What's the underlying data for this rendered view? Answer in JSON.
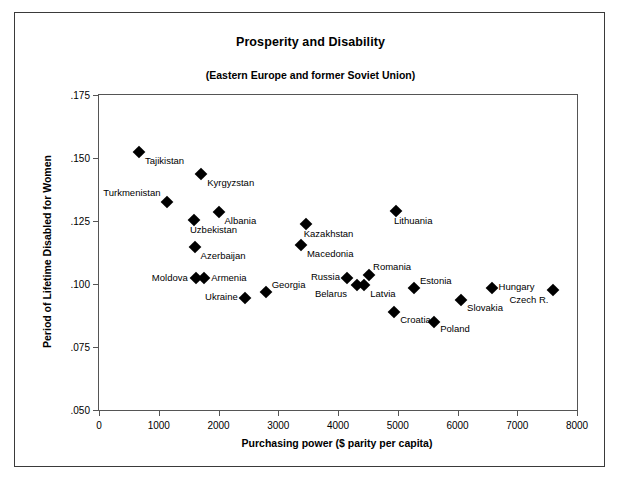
{
  "chart_data": {
    "type": "scatter",
    "title": "Prosperity and Disability",
    "subtitle": "(Eastern Europe and former Soviet Union)",
    "xlabel": "Purchasing power ($ parity per capita)",
    "ylabel": "Period of Lifetime Disabled for Women",
    "xlim": [
      0,
      8000
    ],
    "ylim": [
      0.05,
      0.175
    ],
    "xticks": [
      0,
      1000,
      2000,
      3000,
      4000,
      5000,
      6000,
      7000,
      8000
    ],
    "xticklabels": [
      "0",
      "1000",
      "2000",
      "3000",
      "4000",
      "5000",
      "6000",
      "7000",
      "8000"
    ],
    "yticks": [
      0.05,
      0.075,
      0.1,
      0.125,
      0.15,
      0.175
    ],
    "yticklabels": [
      ".050",
      ".075",
      ".100",
      ".125",
      ".150",
      ".175"
    ],
    "grid": false,
    "legend": false,
    "marker": "diamond",
    "marker_color": "#000000",
    "points": [
      {
        "label": "Tajikistan",
        "x": 670,
        "y": 0.1525,
        "lx": 6,
        "ly": 4,
        "anchor": "start"
      },
      {
        "label": "Kyrgyzstan",
        "x": 1710,
        "y": 0.1435,
        "lx": 6,
        "ly": 4,
        "anchor": "start"
      },
      {
        "label": "Turkmenistan",
        "x": 1130,
        "y": 0.1325,
        "lx": -6,
        "ly": -14,
        "anchor": "end"
      },
      {
        "label": "Uzbekistan",
        "x": 1590,
        "y": 0.1255,
        "lx": -4,
        "ly": 5,
        "anchor": "start"
      },
      {
        "label": "Albania",
        "x": 2000,
        "y": 0.1285,
        "lx": 6,
        "ly": 4,
        "anchor": "start"
      },
      {
        "label": "Azerbaijan",
        "x": 1600,
        "y": 0.1145,
        "lx": 6,
        "ly": 4,
        "anchor": "start"
      },
      {
        "label": "Moldova",
        "x": 1620,
        "y": 0.1025,
        "lx": -8,
        "ly": -5,
        "anchor": "end"
      },
      {
        "label": "Armenia",
        "x": 1760,
        "y": 0.1025,
        "lx": 7,
        "ly": -5,
        "anchor": "start"
      },
      {
        "label": "Ukraine",
        "x": 2440,
        "y": 0.0945,
        "lx": -7,
        "ly": -6,
        "anchor": "end"
      },
      {
        "label": "Georgia",
        "x": 2790,
        "y": 0.097,
        "lx": 6,
        "ly": -12,
        "anchor": "start"
      },
      {
        "label": "Kazakhstan",
        "x": 3460,
        "y": 0.124,
        "lx": -2,
        "ly": 5,
        "anchor": "start"
      },
      {
        "label": "Macedonia",
        "x": 3380,
        "y": 0.1155,
        "lx": 6,
        "ly": 4,
        "anchor": "start"
      },
      {
        "label": "Lithuania",
        "x": 4970,
        "y": 0.129,
        "lx": -2,
        "ly": 5,
        "anchor": "start"
      },
      {
        "label": "Russia",
        "x": 4150,
        "y": 0.1025,
        "lx": -7,
        "ly": -6,
        "anchor": "end"
      },
      {
        "label": "Romania",
        "x": 4520,
        "y": 0.1035,
        "lx": 4,
        "ly": -13,
        "anchor": "start"
      },
      {
        "label": "Belarus",
        "x": 4320,
        "y": 0.0995,
        "lx": -10,
        "ly": 4,
        "anchor": "end"
      },
      {
        "label": "Latvia",
        "x": 4440,
        "y": 0.0995,
        "lx": 6,
        "ly": 4,
        "anchor": "start"
      },
      {
        "label": "Estonia",
        "x": 5270,
        "y": 0.0985,
        "lx": 6,
        "ly": -12,
        "anchor": "start"
      },
      {
        "label": "Croatia",
        "x": 4940,
        "y": 0.089,
        "lx": 6,
        "ly": 3,
        "anchor": "start"
      },
      {
        "label": "Poland",
        "x": 5610,
        "y": 0.085,
        "lx": 6,
        "ly": 2,
        "anchor": "start"
      },
      {
        "label": "Slovakia",
        "x": 6060,
        "y": 0.0935,
        "lx": 6,
        "ly": 3,
        "anchor": "start"
      },
      {
        "label": "Hungary",
        "x": 6570,
        "y": 0.0985,
        "lx": 7,
        "ly": -6,
        "anchor": "start"
      },
      {
        "label": "Czech R.",
        "x": 7590,
        "y": 0.0975,
        "lx": -4,
        "ly": 5,
        "anchor": "end"
      }
    ]
  }
}
